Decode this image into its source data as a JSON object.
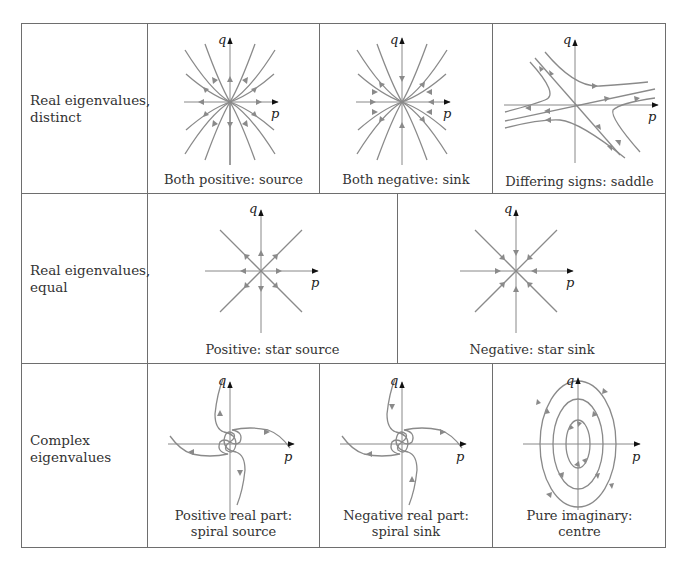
{
  "rows": [
    {
      "label_line1": "Real eigenvalues,",
      "label_line2": "distinct",
      "cells": [
        {
          "caption": "Both positive: source",
          "type": "node-source"
        },
        {
          "caption": "Both negative: sink",
          "type": "node-sink"
        },
        {
          "caption": "Differing signs: saddle",
          "type": "saddle"
        }
      ]
    },
    {
      "label_line1": "Real eigenvalues,",
      "label_line2": "equal",
      "cells": [
        {
          "caption": "Positive: star source",
          "type": "star-source"
        },
        {
          "caption": "Negative: star sink",
          "type": "star-sink"
        }
      ]
    },
    {
      "label_line1": "Complex",
      "label_line2": "eigenvalues",
      "cells": [
        {
          "caption_line1": "Positive real part:",
          "caption_line2": "spiral source",
          "type": "spiral-source"
        },
        {
          "caption_line1": "Negative real part:",
          "caption_line2": "spiral sink",
          "type": "spiral-sink"
        },
        {
          "caption_line1": "Pure imaginary:",
          "caption_line2": "centre",
          "type": "centre"
        }
      ]
    }
  ],
  "axes": {
    "x_label": "p",
    "y_label": "q"
  },
  "colors": {
    "border": "#6e6e6e",
    "trajectory": "#8a8a8a",
    "axis": "#111111"
  }
}
